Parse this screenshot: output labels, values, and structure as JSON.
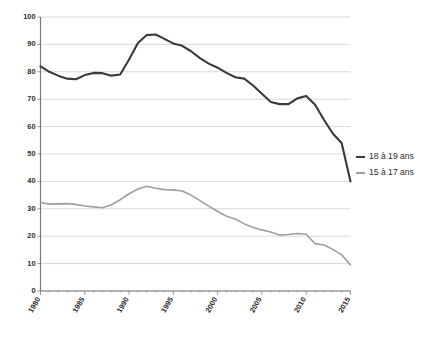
{
  "chart_data": {
    "type": "line",
    "title": "",
    "xlabel": "",
    "ylabel": "",
    "xlim": [
      1980,
      2015
    ],
    "ylim": [
      0,
      100
    ],
    "ytick_step": 10,
    "yticks": [
      0,
      10,
      20,
      30,
      40,
      50,
      60,
      70,
      80,
      90,
      100
    ],
    "xticks": [
      1980,
      1985,
      1990,
      1995,
      2000,
      2005,
      2010,
      2015
    ],
    "xtick_labels": [
      "1980",
      "1985",
      "1990",
      "1995",
      "2000",
      "2005",
      "2010",
      "2015"
    ],
    "ytick_labels": [
      "0",
      "10",
      "20",
      "30",
      "40",
      "50",
      "60",
      "70",
      "80",
      "90",
      "100"
    ],
    "grid": true,
    "grid_axis": "y",
    "legend_position": "right",
    "x": [
      1980,
      1981,
      1982,
      1983,
      1984,
      1985,
      1986,
      1987,
      1988,
      1989,
      1990,
      1991,
      1992,
      1993,
      1994,
      1995,
      1996,
      1997,
      1998,
      1999,
      2000,
      2001,
      2002,
      2003,
      2004,
      2005,
      2006,
      2007,
      2008,
      2009,
      2010,
      2011,
      2012,
      2013,
      2014,
      2015
    ],
    "series": [
      {
        "name": "18 à 19 ans",
        "color": "#3a3a3a",
        "width": 2.1,
        "values": [
          82.0,
          80.0,
          78.6,
          77.5,
          77.3,
          78.8,
          79.6,
          79.5,
          78.6,
          79.0,
          84.5,
          90.5,
          93.4,
          93.6,
          92.0,
          90.3,
          89.5,
          87.5,
          85.0,
          83.0,
          81.5,
          79.6,
          78.0,
          77.5,
          75.0,
          72.0,
          69.0,
          68.2,
          68.2,
          70.3,
          71.2,
          68.0,
          62.5,
          57.5,
          54.0,
          40.0
        ]
      },
      {
        "name": "15 à 17 ans",
        "color": "#9e9e9e",
        "width": 1.6,
        "values": [
          32.3,
          31.7,
          31.8,
          31.9,
          31.6,
          31.0,
          30.7,
          30.4,
          31.5,
          33.3,
          35.5,
          37.2,
          38.2,
          37.5,
          37.0,
          36.9,
          36.5,
          35.0,
          33.0,
          31.0,
          29.0,
          27.3,
          26.3,
          24.5,
          23.2,
          22.3,
          21.5,
          20.4,
          20.6,
          21.0,
          20.7,
          17.3,
          16.8,
          15.2,
          13.2,
          9.5
        ]
      }
    ]
  },
  "legend": {
    "items": [
      {
        "label": "18 à 19 ans",
        "color": "#3a3a3a"
      },
      {
        "label": "15 à 17 ans",
        "color": "#9e9e9e"
      }
    ]
  }
}
